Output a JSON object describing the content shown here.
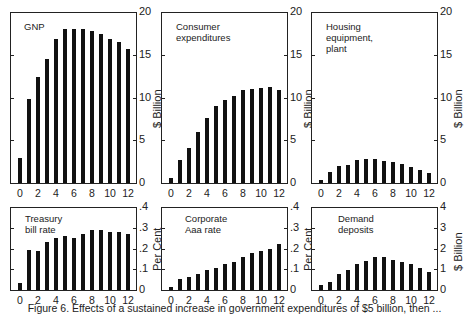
{
  "chart_data": [
    {
      "type": "bar",
      "title": "GNP",
      "categories": [
        "0",
        "1",
        "2",
        "3",
        "4",
        "5",
        "6",
        "7",
        "8",
        "9",
        "10",
        "11",
        "12"
      ],
      "values": [
        2.9,
        9.8,
        12.4,
        14.5,
        16.9,
        18.0,
        18.0,
        18.0,
        17.8,
        17.4,
        16.8,
        16.5,
        15.7
      ],
      "xlabel": "",
      "ylabel": "$ Billion",
      "ylim": [
        0,
        20
      ],
      "yticks": [
        "0",
        "5",
        "10",
        "15",
        "20"
      ],
      "xticks": [
        "0",
        "2",
        "4",
        "6",
        "8",
        "10",
        "12"
      ]
    },
    {
      "type": "bar",
      "title": "Consumer expenditures",
      "categories": [
        "0",
        "1",
        "2",
        "3",
        "4",
        "5",
        "6",
        "7",
        "8",
        "9",
        "10",
        "11",
        "12"
      ],
      "values": [
        0.6,
        2.7,
        4.1,
        6.0,
        7.6,
        9.0,
        9.7,
        10.2,
        10.9,
        11.0,
        11.1,
        11.2,
        10.9
      ],
      "xlabel": "",
      "ylabel": "$ Billion",
      "ylim": [
        0,
        20
      ],
      "yticks": [
        "0",
        "5",
        "10",
        "15",
        "20"
      ],
      "xticks": [
        "0",
        "2",
        "4",
        "6",
        "8",
        "10",
        "12"
      ]
    },
    {
      "type": "bar",
      "title": "Housing equipment,\nplant",
      "categories": [
        "0",
        "1",
        "2",
        "3",
        "4",
        "5",
        "6",
        "7",
        "8",
        "9",
        "10",
        "11",
        "12"
      ],
      "values": [
        0.35,
        1.3,
        2.0,
        2.1,
        2.7,
        2.8,
        2.8,
        2.6,
        2.4,
        2.2,
        1.9,
        1.5,
        1.2
      ],
      "xlabel": "",
      "ylabel": "$ Billion",
      "ylim": [
        0,
        20
      ],
      "yticks": [
        "0",
        "5",
        "10",
        "15",
        "20"
      ],
      "xticks": [
        "0",
        "2",
        "4",
        "6",
        "8",
        "10",
        "12"
      ]
    },
    {
      "type": "bar",
      "title": "Treasury bill rate",
      "categories": [
        "0",
        "1",
        "2",
        "3",
        "4",
        "5",
        "6",
        "7",
        "8",
        "9",
        "10",
        "11",
        "12"
      ],
      "values": [
        0.035,
        0.195,
        0.19,
        0.23,
        0.25,
        0.26,
        0.25,
        0.27,
        0.29,
        0.29,
        0.28,
        0.28,
        0.27
      ],
      "xlabel": "",
      "ylabel": "Per Cent",
      "ylim": [
        0,
        0.4
      ],
      "yticks": [
        "0",
        ".1",
        ".2",
        ".3",
        ".4"
      ],
      "xticks": [
        "0",
        "2",
        "4",
        "6",
        "8",
        "10",
        "12"
      ]
    },
    {
      "type": "bar",
      "title": "Corporate Aaa rate",
      "categories": [
        "0",
        "1",
        "2",
        "3",
        "4",
        "5",
        "6",
        "7",
        "8",
        "9",
        "10",
        "11",
        "12"
      ],
      "values": [
        0.015,
        0.055,
        0.065,
        0.075,
        0.095,
        0.105,
        0.125,
        0.135,
        0.16,
        0.18,
        0.19,
        0.2,
        0.22
      ],
      "xlabel": "",
      "ylabel": "Per Cent",
      "ylim": [
        0,
        0.4
      ],
      "yticks": [
        "0",
        ".1",
        ".2",
        ".3",
        ".4"
      ],
      "xticks": [
        "0",
        "2",
        "4",
        "6",
        "8",
        "10",
        "12"
      ]
    },
    {
      "type": "bar",
      "title": "Demand deposits",
      "categories": [
        "0",
        "1",
        "2",
        "3",
        "4",
        "5",
        "6",
        "7",
        "8",
        "9",
        "10",
        "11",
        "12"
      ],
      "values": [
        0.25,
        0.4,
        0.75,
        0.95,
        1.25,
        1.4,
        1.6,
        1.6,
        1.45,
        1.35,
        1.25,
        1.05,
        0.85
      ],
      "xlabel": "",
      "ylabel": "$ Billion",
      "ylim": [
        0,
        4
      ],
      "yticks": [
        "0",
        "1",
        "2",
        "3",
        "4"
      ],
      "xticks": [
        "0",
        "2",
        "4",
        "6",
        "8",
        "10",
        "12"
      ]
    }
  ],
  "caption": "Figure 6. Effects of a sustained increase in government expenditures of $5 billion, then ..."
}
